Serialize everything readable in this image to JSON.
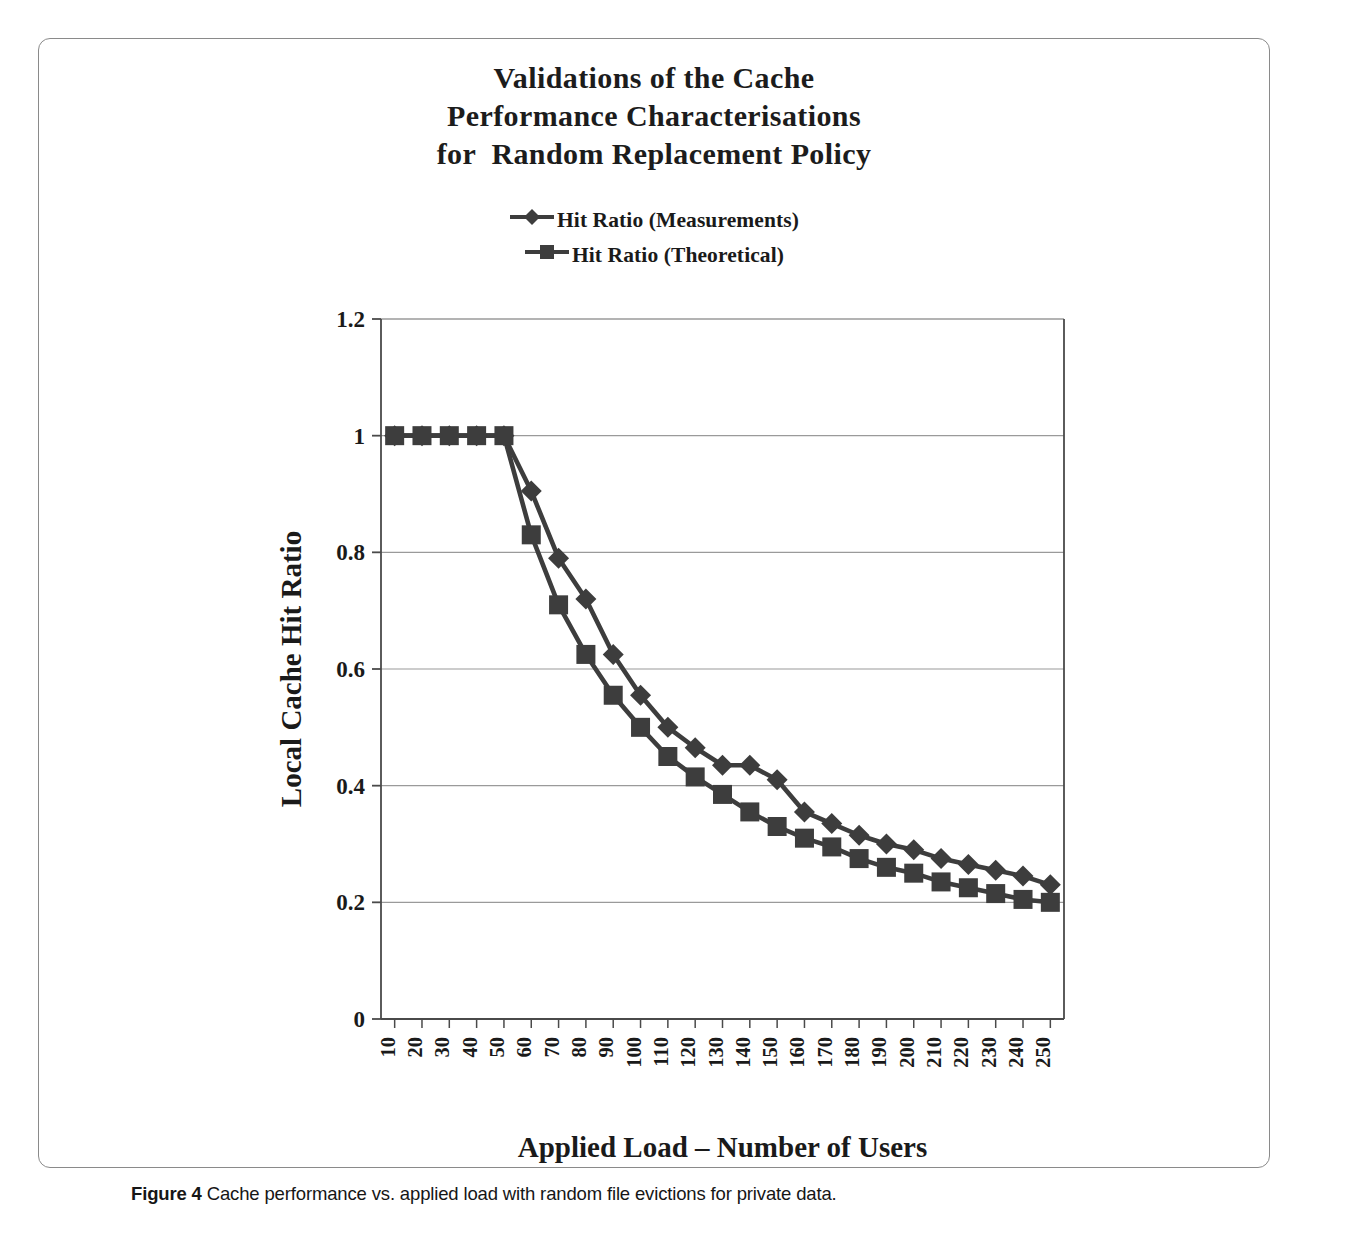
{
  "figure": {
    "title_lines": [
      "Validations of the Cache",
      "Performance Characterisations",
      "for  Random Replacement Policy"
    ],
    "caption_prefix": "Figure 4",
    "caption_text": "Cache performance vs. applied load with random file evictions for private data.",
    "border_color": "#8a8a8a"
  },
  "chart_data": {
    "type": "line",
    "title": "Validations of the Cache Performance Characterisations for  Random Replacement Policy",
    "xlabel": "Applied Load – Number of Users",
    "ylabel": "Local Cache Hit Ratio",
    "categories": [
      10,
      20,
      30,
      40,
      50,
      60,
      70,
      80,
      90,
      100,
      110,
      120,
      130,
      140,
      150,
      160,
      170,
      180,
      190,
      200,
      210,
      220,
      230,
      240,
      250
    ],
    "xtick_labels": [
      "10",
      "20",
      "30",
      "40",
      "50",
      "60",
      "70",
      "80",
      "90",
      "100",
      "110",
      "120",
      "130",
      "140",
      "150",
      "160",
      "170",
      "180",
      "190",
      "200",
      "210",
      "220",
      "230",
      "240",
      "250"
    ],
    "xtick_rotation": 90,
    "ylim": [
      0,
      1.2
    ],
    "ytick_labels": [
      "0",
      "0.2",
      "0.4",
      "0.6",
      "0.8",
      "1",
      "1.2"
    ],
    "ytick_values": [
      0,
      0.2,
      0.4,
      0.6,
      0.8,
      1,
      1.2
    ],
    "grid": "horizontal",
    "legend_position": "above-plot",
    "series": [
      {
        "name": "Hit Ratio (Measurements)",
        "marker": "diamond",
        "color": "#3d3d3d",
        "values": [
          1.0,
          1.0,
          1.0,
          1.0,
          1.0,
          0.905,
          0.79,
          0.72,
          0.625,
          0.555,
          0.5,
          0.465,
          0.435,
          0.435,
          0.41,
          0.355,
          0.335,
          0.315,
          0.3,
          0.29,
          0.275,
          0.265,
          0.255,
          0.245,
          0.23
        ]
      },
      {
        "name": "Hit Ratio (Theoretical)",
        "marker": "square",
        "color": "#3d3d3d",
        "values": [
          1.0,
          1.0,
          1.0,
          1.0,
          1.0,
          0.83,
          0.71,
          0.625,
          0.555,
          0.5,
          0.45,
          0.415,
          0.385,
          0.355,
          0.33,
          0.31,
          0.295,
          0.275,
          0.26,
          0.25,
          0.235,
          0.225,
          0.215,
          0.205,
          0.2
        ]
      }
    ],
    "axis_color": "#4a4a4a",
    "grid_color": "#9a9a9a"
  }
}
